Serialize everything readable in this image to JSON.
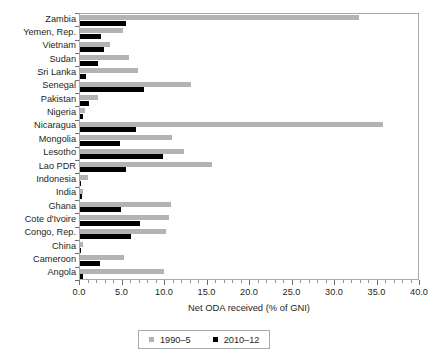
{
  "chart_data": {
    "type": "bar",
    "orientation": "horizontal",
    "title": "",
    "xlabel": "Net ODA received (% of GNI)",
    "ylabel": "",
    "xlim": [
      0.0,
      40.0
    ],
    "xticks": [
      "0.0",
      "5.0",
      "10.0",
      "15.0",
      "20.0",
      "25.0",
      "30.0",
      "35.0",
      "40.0"
    ],
    "xtick_values": [
      0,
      5,
      10,
      15,
      20,
      25,
      30,
      35,
      40
    ],
    "minor_tick_step": 1,
    "grid": false,
    "legend_position": "bottom",
    "categories": [
      "Zambia",
      "Yemen, Rep.",
      "Vietnam",
      "Sudan",
      "Sri Lanka",
      "Senegal",
      "Pakistan",
      "Nigeria",
      "Nicaragua",
      "Mongolia",
      "Lesotho",
      "Lao PDR",
      "Indonesia",
      "India",
      "Ghana",
      "Cote d'Ivoire",
      "Congo, Rep.",
      "China",
      "Cameroon",
      "Angola"
    ],
    "series": [
      {
        "name": "1990–5",
        "color": "#b3b3b3",
        "values": [
          32.8,
          5.1,
          3.5,
          5.8,
          6.8,
          13.1,
          2.1,
          0.6,
          35.6,
          10.8,
          12.2,
          15.5,
          0.9,
          0.4,
          10.7,
          10.5,
          10.1,
          0.3,
          5.2,
          9.9
        ]
      },
      {
        "name": "2010–12",
        "color": "#000000",
        "values": [
          5.4,
          2.5,
          2.8,
          2.1,
          0.7,
          7.5,
          1.1,
          0.3,
          6.6,
          4.7,
          9.8,
          5.4,
          0.1,
          0.2,
          4.8,
          7.1,
          6.0,
          0.05,
          2.3,
          0.3
        ]
      }
    ]
  },
  "legend": {
    "items": [
      {
        "label": "1990–5",
        "color": "#b3b3b3"
      },
      {
        "label": "2010–12",
        "color": "#000000"
      }
    ]
  },
  "axis": {
    "x_title": "Net ODA received (% of GNI)"
  }
}
